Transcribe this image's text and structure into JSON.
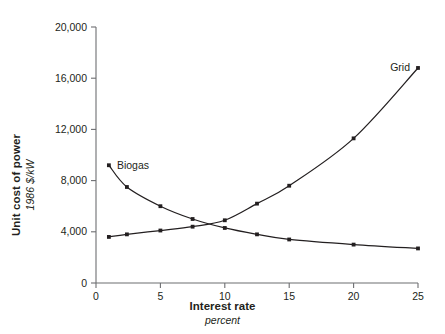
{
  "axes": {
    "y_title": "Unit cost of power",
    "y_subtitle": "1986 $/kW",
    "x_title": "Interest rate",
    "x_subtitle": "percent"
  },
  "chart_data": {
    "type": "line",
    "title": "",
    "subtitle": "",
    "xlabel": "Interest rate",
    "xlabel_units": "percent",
    "ylabel": "Unit cost of power",
    "ylabel_units": "1986 $/kW",
    "xlim": [
      0,
      25
    ],
    "ylim": [
      0,
      20000
    ],
    "xticks": [
      0,
      5,
      10,
      15,
      20,
      25
    ],
    "xticklabels": [
      "0",
      "5",
      "10",
      "15",
      "20",
      "25"
    ],
    "yticks": [
      0,
      4000,
      8000,
      12000,
      16000,
      20000
    ],
    "yticklabels": [
      "0",
      "4,000",
      "8,000",
      "12,000",
      "16,000",
      "20,000"
    ],
    "grid": false,
    "legend": "inline-annotations",
    "marker": "square",
    "series": [
      {
        "name": "Biogas",
        "label_position": "upper-left",
        "x": [
          1,
          2.4,
          5,
          7.5,
          10,
          12.5,
          15,
          20,
          25
        ],
        "y": [
          9200,
          7500,
          6000,
          5000,
          4300,
          3800,
          3400,
          3000,
          2700
        ]
      },
      {
        "name": "Grid",
        "label_position": "upper-right",
        "x": [
          1,
          2.4,
          5,
          7.5,
          10,
          12.5,
          15,
          20,
          25
        ],
        "y": [
          3600,
          3800,
          4100,
          4400,
          4900,
          6200,
          7600,
          11300,
          16800
        ]
      }
    ]
  }
}
